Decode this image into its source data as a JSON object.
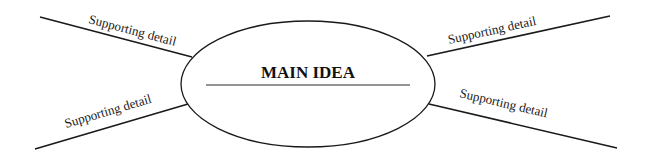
{
  "diagram": {
    "type": "main-idea-web",
    "main_idea": {
      "label": "MAIN IDEA"
    },
    "supporting_details": [
      {
        "position": "top-left",
        "label": "Supporting detail"
      },
      {
        "position": "bottom-left",
        "label": "Supporting detail"
      },
      {
        "position": "top-right",
        "label": "Supporting detail"
      },
      {
        "position": "bottom-right",
        "label": "Supporting detail"
      }
    ]
  }
}
